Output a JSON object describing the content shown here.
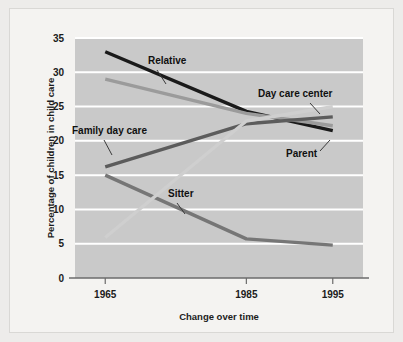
{
  "chart_data": {
    "type": "line",
    "title": "",
    "xlabel": "Change over time",
    "ylabel": "Percentage of children in child care",
    "categories": [
      "1965",
      "1985",
      "1995"
    ],
    "ylim": [
      0,
      35
    ],
    "yticks": [
      0,
      5,
      10,
      15,
      20,
      25,
      30,
      35
    ],
    "ytick_labels": [
      "0",
      "5",
      "10",
      "15",
      "20",
      "25",
      "30",
      "35"
    ],
    "xtick_labels": [
      "1965",
      "1985",
      "1995"
    ],
    "grid": "horizontal-white-gridlines",
    "legend": "inline-annotations",
    "series": [
      {
        "name": "Relative",
        "values": [
          33.0,
          24.3,
          21.5
        ],
        "color": "#1a1a1a"
      },
      {
        "name": "Parent",
        "values": [
          29.0,
          24.0,
          22.2
        ],
        "color": "#9b9b9b"
      },
      {
        "name": "Family day care",
        "values": [
          16.2,
          22.5,
          23.5
        ],
        "color": "#5c5c5c"
      },
      {
        "name": "Sitter",
        "values": [
          15.0,
          5.7,
          4.8
        ],
        "color": "#767676"
      },
      {
        "name": "Day care center",
        "values": [
          5.9,
          22.9,
          25.0
        ],
        "color": "#cfcfcf"
      }
    ],
    "annotations": [
      {
        "label": "Relative",
        "x": 148,
        "y": 64
      },
      {
        "label": "Day care center",
        "x": 258,
        "y": 97
      },
      {
        "label": "Family day care",
        "x": 72,
        "y": 134
      },
      {
        "label": "Parent",
        "x": 286,
        "y": 157
      },
      {
        "label": "Sitter",
        "x": 168,
        "y": 197
      }
    ]
  },
  "colors": {
    "page_background": "#edecea",
    "panel_background": "#f4f3f1",
    "plot_background": "#c9c9c9",
    "gridline": "#ffffff",
    "axis_line": "#6b6b6b",
    "text": "#1b1b1b"
  }
}
